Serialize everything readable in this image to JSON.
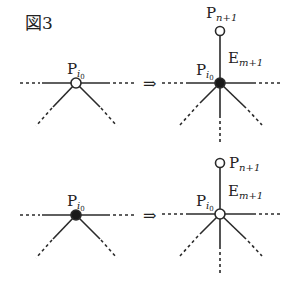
{
  "figure": {
    "title": "図3",
    "arrow": "⇒",
    "colors": {
      "ink": "#2a2a2a",
      "background": "#ffffff",
      "open_node_fill": "#ffffff",
      "filled_node_fill": "#1a1a1a"
    }
  },
  "panels": [
    {
      "id": "top-before",
      "node_label": {
        "base": "P",
        "sub": "i",
        "subsub": "0"
      },
      "node_state": "open"
    },
    {
      "id": "top-after",
      "node_label": {
        "base": "P",
        "sub": "i",
        "subsub": "0"
      },
      "node_state": "filled",
      "new_vertex_label": {
        "base": "P",
        "sub": "n+1"
      },
      "new_vertex_state": "open",
      "new_edge_label": {
        "base": "E",
        "sub": "m+1"
      }
    },
    {
      "id": "bottom-before",
      "node_label": {
        "base": "P",
        "sub": "i",
        "subsub": "0"
      },
      "node_state": "filled"
    },
    {
      "id": "bottom-after",
      "node_label": {
        "base": "P",
        "sub": "i",
        "subsub": "0"
      },
      "node_state": "open",
      "new_vertex_label": {
        "base": "P",
        "sub": "n+1"
      },
      "new_vertex_state": "open",
      "new_edge_label": {
        "base": "E",
        "sub": "m+1"
      }
    }
  ]
}
